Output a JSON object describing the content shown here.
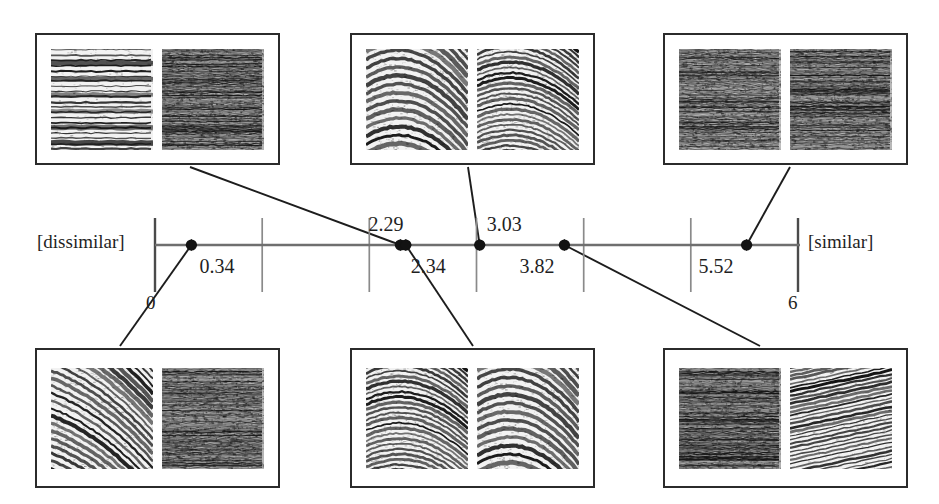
{
  "figure": {
    "type": "one-dimensional-similarity-scale",
    "axis": {
      "left_anchor_label": "[dissimilar]",
      "right_anchor_label": "[similar]",
      "min_tick_label": "0",
      "max_tick_label": "6",
      "tick_values": [
        0,
        1,
        2,
        3,
        4,
        5,
        6
      ],
      "range": [
        0,
        6
      ],
      "line_color": "#6f6f6f",
      "tick_color": "#707070",
      "marker_color": "#1a1a1a"
    },
    "markers": [
      {
        "id": "m1",
        "value": "0.34",
        "label": "0.34",
        "x": 0.34,
        "label_side": "below-right",
        "connects_to": "bottom-left"
      },
      {
        "id": "m2",
        "value": "2.29",
        "label": "2.29",
        "x": 2.29,
        "label_side": "above-right",
        "connects_to": "top-left"
      },
      {
        "id": "m3",
        "value": "2.34",
        "label": "2.34",
        "x": 2.34,
        "label_side": "below-right",
        "connects_to": "bottom-middle"
      },
      {
        "id": "m4",
        "value": "3.03",
        "label": "3.03",
        "x": 3.03,
        "label_side": "above-right",
        "connects_to": "top-middle"
      },
      {
        "id": "m5",
        "value": "3.82",
        "label": "3.82",
        "x": 3.82,
        "label_side": "below-right",
        "connects_to": "bottom-right"
      },
      {
        "id": "m6",
        "value": "5.52",
        "label": "5.52",
        "x": 5.52,
        "label_side": "below-left",
        "connects_to": "top-right"
      }
    ],
    "pair_boxes": [
      {
        "id": "top-left",
        "position": "top",
        "column": "left",
        "rating": "2.29",
        "left_texture": "striped-horizontal-lines",
        "right_texture": "dense-noise-horizontal"
      },
      {
        "id": "top-middle",
        "position": "top",
        "column": "middle",
        "rating": "3.03",
        "left_texture": "curved-wood-grain-chevron",
        "right_texture": "curved-wood-grain-fine"
      },
      {
        "id": "top-right",
        "position": "top",
        "column": "right",
        "rating": "5.52",
        "left_texture": "fine-horizontal-noise",
        "right_texture": "fine-horizontal-noise-dense"
      },
      {
        "id": "bottom-left",
        "position": "bottom",
        "column": "left",
        "rating": "0.34",
        "left_texture": "sparse-wavy-lines",
        "right_texture": "dense-noise-horizontal"
      },
      {
        "id": "bottom-middle",
        "position": "bottom",
        "column": "middle",
        "rating": "2.34",
        "left_texture": "curved-wood-grain-fine",
        "right_texture": "curved-wood-grain-chevron"
      },
      {
        "id": "bottom-right",
        "position": "bottom",
        "column": "right",
        "rating": "3.82",
        "left_texture": "dense-noise-horizontal",
        "right_texture": "diagonal-striped-lines"
      }
    ]
  },
  "chart_data": {
    "type": "scatter",
    "title": "",
    "xlabel": "",
    "ylabel": "",
    "xlim": [
      0,
      6
    ],
    "grid": true,
    "legend": false,
    "x_tick_labels": [
      "0",
      "",
      "",
      "",
      "",
      "",
      "6"
    ],
    "annotations": [
      "[dissimilar]",
      "[similar]"
    ],
    "categories": [
      "0.34",
      "2.29",
      "2.34",
      "3.03",
      "3.82",
      "5.52"
    ],
    "values": [
      0.34,
      2.29,
      2.34,
      3.03,
      3.82,
      5.52
    ]
  }
}
